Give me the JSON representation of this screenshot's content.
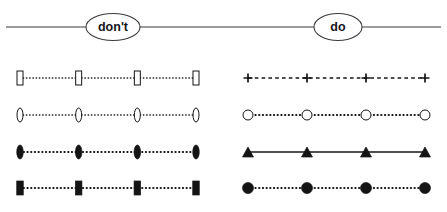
{
  "figure": {
    "title": "",
    "width": 447,
    "height": 212,
    "background": "#ffffff",
    "ink_color": "#141414",
    "axis_color": "#3a3a3a"
  },
  "header": {
    "rule_y": 27,
    "rule_start_x": 6,
    "rule_end_x": 441,
    "bubbles": [
      {
        "id": "dont",
        "label": "don't",
        "cx": 113,
        "cy": 27,
        "rx": 27,
        "ry": 13.5
      },
      {
        "id": "do",
        "label": "do",
        "cx": 338,
        "cy": 27,
        "rx": 24,
        "ry": 13.5
      }
    ]
  },
  "panels": [
    {
      "id": "dont-panel",
      "group_label": "don't",
      "x_start": 20,
      "x_end": 196,
      "marker_count": 4,
      "series": [
        {
          "id": "dont-row-1",
          "row": 1,
          "y": 78,
          "line_style": "dotted",
          "line_class": "line-dotted",
          "marker": "open-rect-tall",
          "marker_label": "open vertical rectangle",
          "marker_w": 6,
          "marker_h": 14,
          "fill": "#ffffff",
          "stroke": "#141414"
        },
        {
          "id": "dont-row-2",
          "row": 2,
          "y": 115,
          "line_style": "dotted",
          "line_class": "line-dotted",
          "marker": "open-ellipse-tall",
          "marker_label": "open vertical ellipse",
          "marker_w": 6,
          "marker_h": 14,
          "fill": "#ffffff",
          "stroke": "#141414"
        },
        {
          "id": "dont-row-3",
          "row": 3,
          "y": 152,
          "line_style": "dotted",
          "line_class": "line-dotted-thick",
          "marker": "filled-ellipse-tall",
          "marker_label": "filled vertical ellipse",
          "marker_w": 6.5,
          "marker_h": 14,
          "fill": "#141414",
          "stroke": "#141414"
        },
        {
          "id": "dont-row-4",
          "row": 4,
          "y": 188,
          "line_style": "dotted",
          "line_class": "line-dotted-thick",
          "marker": "filled-rect-tall",
          "marker_label": "filled vertical rectangle",
          "marker_w": 6.5,
          "marker_h": 14,
          "fill": "#141414",
          "stroke": "#141414"
        }
      ]
    },
    {
      "id": "do-panel",
      "group_label": "do",
      "x_start": 248,
      "x_end": 425,
      "marker_count": 4,
      "series": [
        {
          "id": "do-row-1",
          "row": 1,
          "y": 78,
          "line_style": "dashed",
          "line_class": "line-dashed",
          "marker": "plus",
          "marker_label": "plus sign",
          "marker_w": 9,
          "marker_h": 9,
          "fill": "none",
          "stroke": "#141414"
        },
        {
          "id": "do-row-2",
          "row": 2,
          "y": 115,
          "line_style": "dotted",
          "line_class": "line-dotted-thick",
          "marker": "open-circle",
          "marker_label": "open circle",
          "marker_w": 10,
          "marker_h": 10,
          "fill": "#ffffff",
          "stroke": "#141414"
        },
        {
          "id": "do-row-3",
          "row": 3,
          "y": 152,
          "line_style": "solid",
          "line_class": "line-solid",
          "marker": "filled-triangle",
          "marker_label": "filled triangle",
          "marker_w": 11,
          "marker_h": 10,
          "fill": "#141414",
          "stroke": "#141414"
        },
        {
          "id": "do-row-4",
          "row": 4,
          "y": 188,
          "line_style": "dotted",
          "line_class": "line-dotted-thick",
          "marker": "filled-circle",
          "marker_label": "filled circle",
          "marker_w": 11,
          "marker_h": 11,
          "fill": "#141414",
          "stroke": "#141414"
        }
      ]
    }
  ],
  "chart_data": {
    "type": "line",
    "title": "",
    "subtitle": "",
    "xlabel": "",
    "ylabel": "",
    "grid": false,
    "legend_position": "none",
    "annotations": [
      "don't",
      "do"
    ],
    "x": [
      0,
      1,
      2,
      3
    ],
    "series": [
      {
        "name": "don't row 1",
        "values": [
          1,
          1,
          1,
          1
        ],
        "line_style": "dotted",
        "marker": "open-rect-tall"
      },
      {
        "name": "don't row 2",
        "values": [
          1,
          1,
          1,
          1
        ],
        "line_style": "dotted",
        "marker": "open-ellipse-tall"
      },
      {
        "name": "don't row 3",
        "values": [
          1,
          1,
          1,
          1
        ],
        "line_style": "dotted",
        "marker": "filled-ellipse-tall"
      },
      {
        "name": "don't row 4",
        "values": [
          1,
          1,
          1,
          1
        ],
        "line_style": "dotted",
        "marker": "filled-rect-tall"
      },
      {
        "name": "do row 1",
        "values": [
          1,
          1,
          1,
          1
        ],
        "line_style": "dashed",
        "marker": "plus"
      },
      {
        "name": "do row 2",
        "values": [
          1,
          1,
          1,
          1
        ],
        "line_style": "dotted",
        "marker": "open-circle"
      },
      {
        "name": "do row 3",
        "values": [
          1,
          1,
          1,
          1
        ],
        "line_style": "solid",
        "marker": "filled-triangle"
      },
      {
        "name": "do row 4",
        "values": [
          1,
          1,
          1,
          1
        ],
        "line_style": "dotted",
        "marker": "filled-circle"
      }
    ]
  }
}
